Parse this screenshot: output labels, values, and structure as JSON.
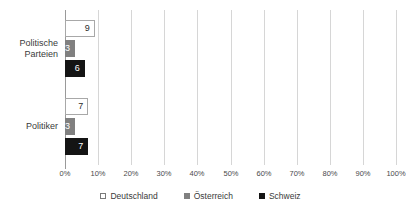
{
  "chart_data": {
    "type": "bar",
    "orientation": "horizontal",
    "title": "",
    "subtitle": "",
    "xlabel": "",
    "ylabel": "",
    "xlim": [
      0,
      100
    ],
    "xtick_step": 10,
    "grid": true,
    "legend_position": "bottom",
    "categories": [
      "Politische Parteien",
      "Politiker"
    ],
    "category_label_lines": [
      [
        "Politische",
        "Parteien"
      ],
      [
        "Politiker"
      ]
    ],
    "xticks": [
      "0%",
      "10%",
      "20%",
      "30%",
      "40%",
      "50%",
      "60%",
      "70%",
      "80%",
      "90%",
      "100%"
    ],
    "xtick_values": [
      0,
      10,
      20,
      30,
      40,
      50,
      60,
      70,
      80,
      90,
      100
    ],
    "series": [
      {
        "name": "Deutschland",
        "color": "#ffffff",
        "border_color": "#a8a8a8",
        "label_color": "#2b2b2b",
        "values": [
          9,
          7
        ],
        "value_labels": [
          "9",
          "7"
        ]
      },
      {
        "name": "Österreich",
        "color": "#808080",
        "border_color": "#808080",
        "label_color": "#ffffff",
        "values": [
          3,
          3
        ],
        "value_labels": [
          "3",
          "3"
        ]
      },
      {
        "name": "Schweiz",
        "color": "#141414",
        "border_color": "#141414",
        "label_color": "#ffffff",
        "values": [
          6,
          7
        ],
        "value_labels": [
          "6",
          "7"
        ]
      }
    ],
    "legend": [
      {
        "label": "Deutschland",
        "swatch": "s-de"
      },
      {
        "label": "Österreich",
        "swatch": "s-at"
      },
      {
        "label": "Schweiz",
        "swatch": "s-ch"
      }
    ],
    "axis_color": "#9a9a9a",
    "gridline_color": "#d6d6d6"
  }
}
